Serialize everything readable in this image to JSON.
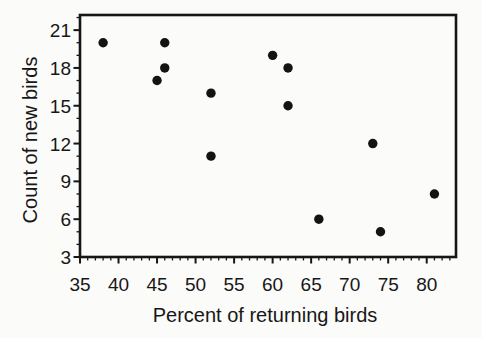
{
  "figure": {
    "background": "#fbfbf9",
    "frame_color": "#161616",
    "tick_color": "#161616",
    "point_color": "#131313",
    "text_color": "#171717"
  },
  "chart_data": {
    "type": "scatter",
    "title": "",
    "xlabel": "Percent of returning birds",
    "ylabel": "Count of new birds",
    "xlim": [
      35,
      83.8
    ],
    "ylim": [
      3,
      22.2
    ],
    "x_major_ticks": [
      35,
      40,
      45,
      50,
      55,
      60,
      65,
      70,
      75,
      80
    ],
    "y_major_ticks": [
      3,
      6,
      9,
      12,
      15,
      18,
      21
    ],
    "minor_tick_interval": 1,
    "grid": false,
    "legend": "none",
    "marker": "filled-circle",
    "points": [
      {
        "x": 38,
        "y": 20
      },
      {
        "x": 45,
        "y": 17
      },
      {
        "x": 46,
        "y": 18
      },
      {
        "x": 46,
        "y": 20
      },
      {
        "x": 52,
        "y": 11
      },
      {
        "x": 52,
        "y": 16
      },
      {
        "x": 60,
        "y": 19
      },
      {
        "x": 62,
        "y": 15
      },
      {
        "x": 62,
        "y": 18
      },
      {
        "x": 66,
        "y": 6
      },
      {
        "x": 73,
        "y": 12
      },
      {
        "x": 74,
        "y": 5
      },
      {
        "x": 81,
        "y": 8
      }
    ]
  }
}
